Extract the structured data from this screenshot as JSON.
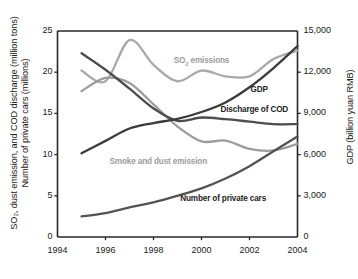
{
  "chart_data": {
    "type": "line",
    "title": "",
    "xlabel": "",
    "ylabel": "SO2, dust emission, and COD discharge (million tons) / Number of private cars (millions)",
    "ylabel_left_line1": "SO₂, dust emission, and COD discharge (million tons)",
    "ylabel_left_line2": "Number of private cars (millions)",
    "ylabel_right": "GDP (billion yuan RMB)",
    "xlim": [
      1994,
      2004
    ],
    "ylim_left": [
      0,
      25
    ],
    "ylim_right": [
      0,
      15000
    ],
    "grid": false,
    "legend_position": "inline-annotations",
    "xticks": [
      "1994",
      "1996",
      "1998",
      "2000",
      "2002",
      "2004"
    ],
    "xtick_values": [
      1994,
      1996,
      1998,
      2000,
      2002,
      2004
    ],
    "yticks_left": [
      "0",
      "5",
      "10",
      "15",
      "20",
      "25"
    ],
    "ytick_values_left": [
      0,
      5,
      10,
      15,
      20,
      25
    ],
    "yticks_right": [
      "0",
      "3,000",
      "6,000",
      "9,000",
      "12,000",
      "15,000"
    ],
    "ytick_values_right": [
      0,
      3000,
      6000,
      9000,
      12000,
      15000
    ],
    "x": [
      1995,
      1996,
      1997,
      1998,
      1999,
      2000,
      2001,
      2002,
      2003,
      2004
    ],
    "series": [
      {
        "name": "SO2 emissions",
        "label": "SO₂ emissions",
        "axis": "left",
        "color": "#a9a9a9",
        "units": "million tons",
        "values": [
          20.2,
          18.9,
          23.9,
          20.9,
          18.9,
          20.2,
          19.5,
          19.5,
          21.6,
          22.6
        ]
      },
      {
        "name": "Smoke and dust emission",
        "label": "Smoke and dust emission",
        "axis": "left",
        "color": "#9c9c9c",
        "units": "million tons",
        "values": [
          17.7,
          19.3,
          18.7,
          16.1,
          13.4,
          11.6,
          11.7,
          10.7,
          10.5,
          11.3
        ]
      },
      {
        "name": "Discharge of COD",
        "label": "Discharge of COD",
        "axis": "left",
        "color": "#4d4d4d",
        "units": "million tons",
        "values": [
          22.3,
          20.3,
          18.0,
          15.6,
          14.1,
          14.5,
          14.3,
          14.0,
          13.7,
          13.7
        ]
      },
      {
        "name": "Number of private cars",
        "label": "Number of private cars",
        "axis": "left",
        "color": "#535353",
        "units": "millions",
        "values": [
          2.5,
          2.9,
          3.6,
          4.2,
          5.0,
          5.9,
          7.1,
          8.6,
          10.4,
          12.2
        ]
      },
      {
        "name": "GDP",
        "label": "GDP",
        "axis": "right",
        "color": "#3b3b3b",
        "units": "billion yuan RMB",
        "values": [
          6100,
          7000,
          7900,
          8300,
          8600,
          9100,
          9800,
          10900,
          12300,
          13900
        ]
      }
    ],
    "annotations": [
      {
        "text": "SO₂ emissions",
        "x": 2000,
        "y": 21.3,
        "style": "light"
      },
      {
        "text": "GDP",
        "x": 2002.4,
        "y": 17.9,
        "style": "bold"
      },
      {
        "text": "Discharge of COD",
        "x": 2002.2,
        "y": 15.4,
        "style": "bold"
      },
      {
        "text": "Smoke and dust emission",
        "x": 1998.2,
        "y": 9.1,
        "style": "light"
      },
      {
        "text": "Number of private cars",
        "x": 2000.9,
        "y": 4.6,
        "style": "bold"
      }
    ]
  },
  "axes": {
    "left_title_line1": "SO₂, dust emission, and COD discharge (million tons)",
    "left_title_line2": "Number of private cars (millions)",
    "right_title": "GDP (billion yuan RMB)"
  },
  "colors": {
    "axis": "#262626",
    "light_gray": "#a9a9a9",
    "mid_gray": "#9c9c9c",
    "dark_gray": "#4d4d4d",
    "darkest": "#3b3b3b",
    "background": "#ffffff"
  }
}
